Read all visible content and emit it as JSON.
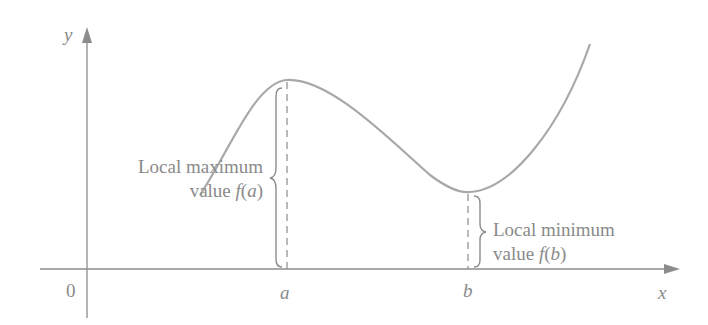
{
  "diagram": {
    "axes": {
      "x_label": "x",
      "y_label": "y",
      "origin_label": "0"
    },
    "points": {
      "a_label": "a",
      "b_label": "b"
    },
    "annotations": {
      "max": {
        "line1": "Local maximum",
        "line2_prefix": "value ",
        "line2_func": "f",
        "line2_open": "(",
        "line2_arg": "a",
        "line2_close": ")"
      },
      "min": {
        "line1": "Local minimum",
        "line2_prefix": "value ",
        "line2_func": "f",
        "line2_open": "(",
        "line2_arg": "b",
        "line2_close": ")"
      }
    },
    "colors": {
      "curve": "#a8a8a8",
      "axis": "#8c8c8c",
      "text": "#8a8a8a"
    }
  }
}
